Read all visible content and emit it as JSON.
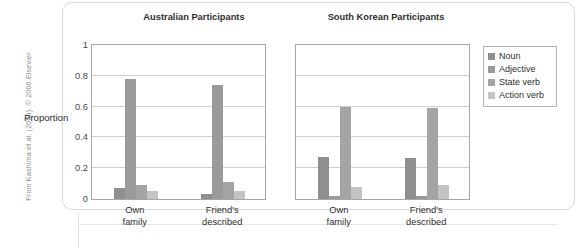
{
  "source_credit": "From Kashima et al. (2006). © 2006 Elsevier",
  "legend": {
    "items": [
      {
        "label": "Noun",
        "color": "#8f8f8f"
      },
      {
        "label": "Adjective",
        "color": "#9a9a9a"
      },
      {
        "label": "State verb",
        "color": "#a4a4a4"
      },
      {
        "label": "Action verb",
        "color": "#c4c4c4"
      }
    ]
  },
  "axis": {
    "ylabel": "Proportion",
    "yticks": [
      "1",
      "0.8",
      "0.6",
      "0.4",
      "0.2",
      "0"
    ],
    "ytick_values": [
      1,
      0.8,
      0.6,
      0.4,
      0.2,
      0
    ]
  },
  "chart_data": {
    "type": "bar",
    "title": "",
    "xlabel": "",
    "ylabel": "Proportion",
    "ylim": [
      0,
      1
    ],
    "grid": true,
    "legend_position": "right",
    "panels": [
      {
        "title": "Australian Participants",
        "categories": [
          "Own\nfamily",
          "Friend's\ndescribed"
        ],
        "category_lines": [
          [
            "Own",
            "family"
          ],
          [
            "Friend's",
            "described"
          ]
        ],
        "series": [
          {
            "name": "Noun",
            "color": "#8f8f8f",
            "values": [
              0.07,
              0.03
            ]
          },
          {
            "name": "Adjective",
            "color": "#9a9a9a",
            "values": [
              0.78,
              0.74
            ]
          },
          {
            "name": "State verb",
            "color": "#a4a4a4",
            "values": [
              0.09,
              0.11
            ]
          },
          {
            "name": "Action verb",
            "color": "#c4c4c4",
            "values": [
              0.05,
              0.05
            ]
          }
        ]
      },
      {
        "title": "South Korean Participants",
        "categories": [
          "Own\nfamily",
          "Friend's\ndescribed"
        ],
        "category_lines": [
          [
            "Own",
            "family"
          ],
          [
            "Friend's",
            "described"
          ]
        ],
        "series": [
          {
            "name": "Noun",
            "color": "#8f8f8f",
            "values": [
              0.27,
              0.265
            ]
          },
          {
            "name": "Adjective",
            "color": "#9a9a9a",
            "values": [
              0.02,
              0.02
            ]
          },
          {
            "name": "State verb",
            "color": "#a4a4a4",
            "values": [
              0.6,
              0.59
            ]
          },
          {
            "name": "Action verb",
            "color": "#c4c4c4",
            "values": [
              0.08,
              0.09
            ]
          }
        ]
      }
    ]
  }
}
